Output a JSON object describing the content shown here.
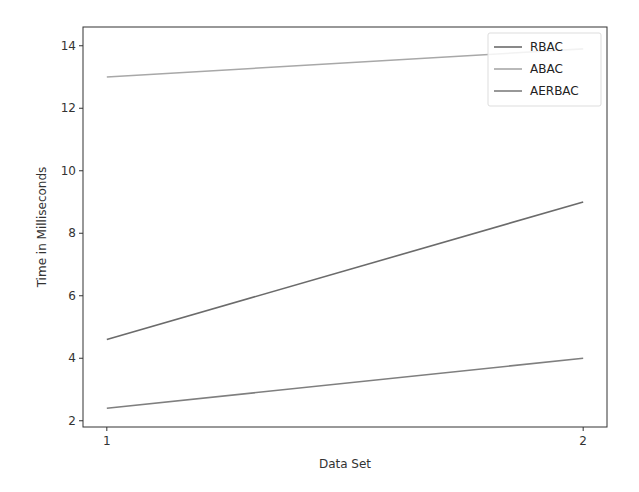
{
  "chart_data": {
    "type": "line",
    "title": "",
    "xlabel": "Data Set",
    "ylabel": "Time in Milliseconds",
    "x": [
      1,
      2
    ],
    "x_ticks": [
      "1",
      "2"
    ],
    "y_ticks": [
      "2",
      "4",
      "6",
      "8",
      "10",
      "12",
      "14"
    ],
    "ylim": [
      1.8,
      14.6
    ],
    "xlim": [
      0.95,
      2.05
    ],
    "grid": false,
    "legend_position": "upper right",
    "series": [
      {
        "name": "RBAC",
        "values": [
          4.6,
          9.0
        ],
        "color": "#6b6b6b"
      },
      {
        "name": "ABAC",
        "values": [
          13.0,
          13.9
        ],
        "color": "#a8a8a8"
      },
      {
        "name": "AERBAC",
        "values": [
          2.4,
          4.0
        ],
        "color": "#7f7f7f"
      }
    ]
  }
}
